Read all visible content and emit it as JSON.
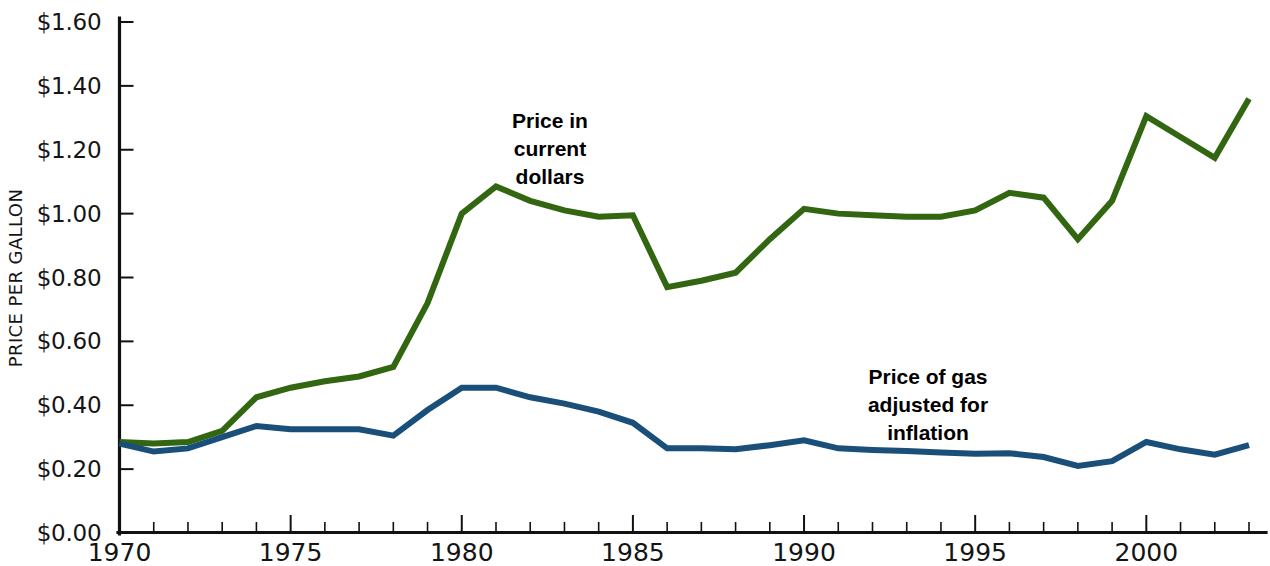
{
  "chart_data": {
    "type": "line",
    "title": "",
    "subtitle": "",
    "xlabel": "",
    "ylabel": "PRICE PER GALLON",
    "xlim": [
      1970,
      2003
    ],
    "ylim": [
      0.0,
      1.6
    ],
    "grid": false,
    "legend_position": "inline-annotations",
    "x_tick_labels": [
      "1970",
      "1975",
      "1980",
      "1985",
      "1990",
      "1995",
      "2000"
    ],
    "x_tick_values": [
      1970,
      1975,
      1980,
      1985,
      1990,
      1995,
      2000
    ],
    "x_minor_tick_step": 1,
    "y_tick_labels": [
      "$0.00",
      "$0.20",
      "$0.40",
      "$0.60",
      "$0.80",
      "$1.00",
      "$1.20",
      "$1.40",
      "$1.60"
    ],
    "y_tick_values": [
      0.0,
      0.2,
      0.4,
      0.6,
      0.8,
      1.0,
      1.2,
      1.4,
      1.6
    ],
    "x": [
      1970,
      1971,
      1972,
      1973,
      1974,
      1975,
      1976,
      1977,
      1978,
      1979,
      1980,
      1981,
      1982,
      1983,
      1984,
      1985,
      1986,
      1987,
      1988,
      1989,
      1990,
      1991,
      1992,
      1993,
      1994,
      1995,
      1996,
      1997,
      1998,
      1999,
      2000,
      2001,
      2002,
      2003
    ],
    "series": [
      {
        "name": "Price in current dollars",
        "color": "#336611",
        "values": [
          0.285,
          0.28,
          0.285,
          0.32,
          0.425,
          0.455,
          0.475,
          0.49,
          0.52,
          0.72,
          1.0,
          1.085,
          1.04,
          1.01,
          0.99,
          0.995,
          0.77,
          0.79,
          0.815,
          0.92,
          1.015,
          1.0,
          0.995,
          0.99,
          0.99,
          1.01,
          1.065,
          1.05,
          0.92,
          1.04,
          1.305,
          1.24,
          1.175,
          1.36
        ]
      },
      {
        "name": "Price of gas adjusted for inflation",
        "color": "#1a4f7a",
        "values": [
          0.28,
          0.255,
          0.265,
          0.3,
          0.335,
          0.325,
          0.325,
          0.325,
          0.305,
          0.385,
          0.455,
          0.455,
          0.425,
          0.405,
          0.38,
          0.345,
          0.265,
          0.265,
          0.262,
          0.275,
          0.29,
          0.265,
          0.26,
          0.257,
          0.252,
          0.248,
          0.25,
          0.238,
          0.21,
          0.225,
          0.285,
          0.262,
          0.245,
          0.275
        ]
      }
    ],
    "annotations": [
      {
        "id": "annotation-current-dollars",
        "lines": [
          "Price in",
          "current",
          "dollars"
        ],
        "x_px": 550,
        "y_px": 128,
        "color": "#000000"
      },
      {
        "id": "annotation-inflation-adjusted",
        "lines": [
          "Price of gas",
          "adjusted for",
          "inflation"
        ],
        "x_px": 928,
        "y_px": 384,
        "color": "#000000"
      }
    ]
  },
  "axis": {
    "y_title": "PRICE PER GALLON"
  },
  "colors": {
    "current_dollars": "#336611",
    "inflation_adjusted": "#1a4f7a",
    "axis": "#111111",
    "background": "#ffffff"
  }
}
